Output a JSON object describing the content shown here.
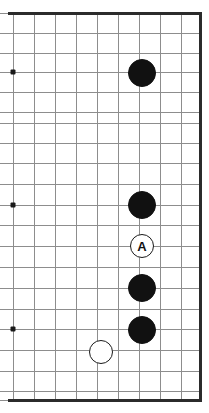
{
  "figure": {
    "width": 209,
    "height": 413,
    "background_color": "#ffffff",
    "line_color": "#8d8d8d",
    "edge_color": "#2b2b2b",
    "black_stone_color": "#111111",
    "white_stone_color": "#ffffff",
    "white_stone_border_color": "#1a1a1a"
  },
  "board": {
    "description": "Partial go board crop showing the right edge of the board",
    "visible_columns": 10,
    "visible_rows": 19,
    "cell_size": 20.8,
    "origin_x": 13,
    "origin_y": 13,
    "edges_drawn": [
      "top",
      "right",
      "bottom"
    ],
    "column_x": [
      13,
      33.8,
      54.6,
      75.4,
      96.2,
      117,
      137.8,
      158.6,
      179.4,
      200.2
    ],
    "row_y": [
      13,
      32.6,
      52.4,
      72.2,
      92,
      111.8,
      131.6,
      151.4,
      171.2,
      191,
      205,
      225.4,
      246,
      266.6,
      287.2,
      308,
      329,
      349.8,
      370.6,
      390.4,
      400
    ]
  },
  "grid": {
    "horizontal_lines_y": [
      13,
      33,
      53,
      72,
      92,
      112,
      123,
      143,
      163,
      184,
      205,
      225,
      246,
      267,
      288,
      309,
      329,
      350,
      371,
      391,
      400
    ],
    "vertical_lines_x": [
      13,
      34,
      55,
      76,
      97,
      118,
      139,
      160,
      181,
      199
    ]
  },
  "star_points": [
    {
      "name": "star-point-top",
      "x": 13,
      "y": 72
    },
    {
      "name": "star-point-middle",
      "x": 13,
      "y": 205
    },
    {
      "name": "star-point-bottom",
      "x": 13,
      "y": 329
    }
  ],
  "stones": [
    {
      "id": "black-1",
      "color": "black",
      "x": 142,
      "y": 73,
      "radius": 14,
      "label": ""
    },
    {
      "id": "black-2",
      "color": "black",
      "x": 142,
      "y": 205,
      "radius": 14,
      "label": ""
    },
    {
      "id": "white-a",
      "color": "white",
      "x": 142,
      "y": 246,
      "radius": 12,
      "label": "A"
    },
    {
      "id": "black-3",
      "color": "black",
      "x": 142,
      "y": 288,
      "radius": 14,
      "label": ""
    },
    {
      "id": "black-4",
      "color": "black",
      "x": 142,
      "y": 330,
      "radius": 14,
      "label": ""
    },
    {
      "id": "white-1",
      "color": "white",
      "x": 101,
      "y": 352,
      "radius": 12,
      "label": ""
    }
  ],
  "labels": {
    "marked_point": "A"
  }
}
